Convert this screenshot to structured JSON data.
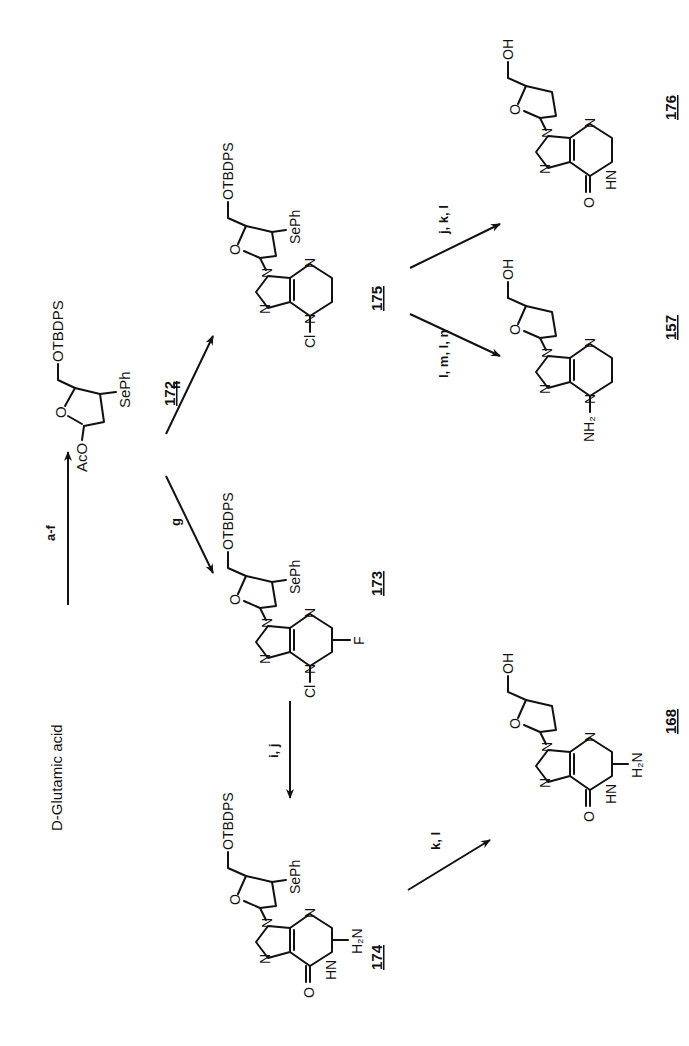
{
  "scheme": {
    "starting_material": "D-Glutamic acid",
    "steps": [
      {
        "from": "D-Glutamic acid",
        "to": "172",
        "reagents": "a-f"
      },
      {
        "from": "172",
        "to": "173",
        "reagents": "g"
      },
      {
        "from": "172",
        "to": "175",
        "reagents": "h"
      },
      {
        "from": "173",
        "to": "174",
        "reagents": "i, j"
      },
      {
        "from": "174",
        "to": "168",
        "reagents": "k, l"
      },
      {
        "from": "175",
        "to": "157",
        "reagents": "l, m, l, n"
      },
      {
        "from": "175",
        "to": "176",
        "reagents": "j, k, l"
      }
    ],
    "compounds": {
      "c172": {
        "id": "172",
        "protecting_group": "OTBDPS",
        "acyloxy": "AcO",
        "ring_o": "O",
        "substituent": "SePh"
      },
      "c173": {
        "id": "173",
        "protecting_group": "OTBDPS",
        "ring_o": "O",
        "substituent": "SePh",
        "halogen1": "Cl",
        "halogen2": "F",
        "n": "N"
      },
      "c175": {
        "id": "175",
        "protecting_group": "OTBDPS",
        "ring_o": "O",
        "substituent": "SePh",
        "halogen1": "Cl",
        "n": "N"
      },
      "c174": {
        "id": "174",
        "protecting_group": "OTBDPS",
        "ring_o": "O",
        "substituent": "SePh",
        "carbonyl_o": "O",
        "nh": "HN",
        "amine": "H₂N",
        "n": "N"
      },
      "c168": {
        "id": "168",
        "hydroxyl": "OH",
        "ring_o": "O",
        "carbonyl_o": "O",
        "nh": "HN",
        "amine": "H₂N",
        "n": "N"
      },
      "c157": {
        "id": "157",
        "hydroxyl": "OH",
        "ring_o": "O",
        "amine": "NH₂",
        "n": "N"
      },
      "c176": {
        "id": "176",
        "hydroxyl": "OH",
        "ring_o": "O",
        "carbonyl_o": "O",
        "nh": "HN",
        "n": "N"
      }
    }
  }
}
